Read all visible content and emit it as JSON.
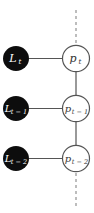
{
  "diagram": {
    "type": "graphical-model-chain",
    "colors": {
      "background": "#ffffff",
      "observed_fill": "#0d0d0d",
      "observed_text": "#ffffff",
      "latent_fill": "#ffffff",
      "latent_stroke": "#555555",
      "latent_text": "#333333",
      "edge": "#555555",
      "dashed": "#9a9a9a"
    },
    "nodes": [
      {
        "id": "L_t",
        "kind": "observed",
        "base": "L",
        "sub": "t",
        "cx": 16,
        "cy": 58.5
      },
      {
        "id": "p_t",
        "kind": "latent",
        "base": "p",
        "sub": "t",
        "cx": 76,
        "cy": 58.5
      },
      {
        "id": "L_t-1",
        "kind": "observed",
        "base": "L",
        "sub": "t − 1",
        "cx": 16,
        "cy": 108.5
      },
      {
        "id": "p_t-1",
        "kind": "latent",
        "base": "p",
        "sub": "t − 1",
        "cx": 76,
        "cy": 108.5
      },
      {
        "id": "L_t-2",
        "kind": "observed",
        "base": "L",
        "sub": "t − 2",
        "cx": 16,
        "cy": 158.5
      },
      {
        "id": "p_t-2",
        "kind": "latent",
        "base": "p",
        "sub": "t − 2",
        "cx": 76,
        "cy": 158.5
      }
    ],
    "edges": [
      {
        "from": "L_t",
        "to": "p_t"
      },
      {
        "from": "L_t-1",
        "to": "p_t-1"
      },
      {
        "from": "L_t-2",
        "to": "p_t-2"
      },
      {
        "from": "p_t",
        "to": "p_t-1"
      },
      {
        "from": "p_t-1",
        "to": "p_t-2"
      }
    ],
    "dashed_continuations": [
      {
        "position": "top",
        "x": 76,
        "y1": 10,
        "y2": 44
      },
      {
        "position": "bottom",
        "x": 76,
        "y1": 173,
        "y2": 206
      }
    ]
  }
}
